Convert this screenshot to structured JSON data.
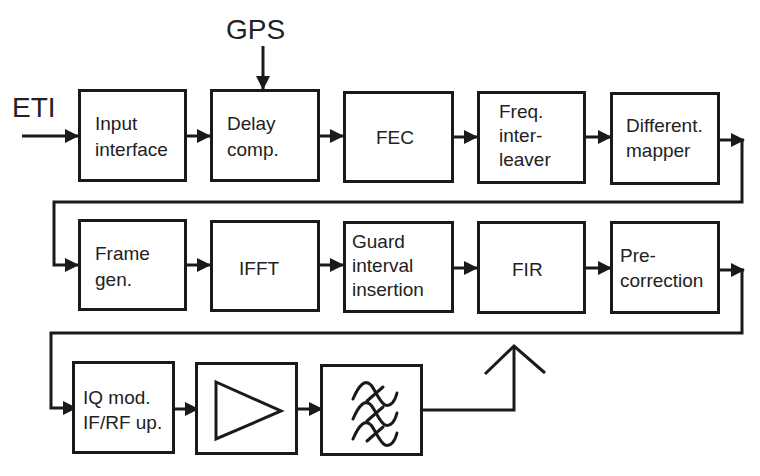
{
  "inputs": {
    "eti": "ETI",
    "gps": "GPS"
  },
  "row1": [
    {
      "id": "input-interface",
      "line1": "Input",
      "line2": "interface",
      "line3": ""
    },
    {
      "id": "delay-comp",
      "line1": "Delay",
      "line2": "comp.",
      "line3": ""
    },
    {
      "id": "fec",
      "line1": "FEC",
      "line2": "",
      "line3": ""
    },
    {
      "id": "freq-interleaver",
      "line1": "Freq.",
      "line2": "inter-",
      "line3": "leaver"
    },
    {
      "id": "differential-mapper",
      "line1": "Different.",
      "line2": "mapper",
      "line3": ""
    }
  ],
  "row2": [
    {
      "id": "frame-gen",
      "line1": "Frame",
      "line2": "gen.",
      "line3": ""
    },
    {
      "id": "ifft",
      "line1": "IFFT",
      "line2": "",
      "line3": ""
    },
    {
      "id": "guard-interval-insertion",
      "line1": "Guard",
      "line2": "interval",
      "line3": "insertion"
    },
    {
      "id": "fir",
      "line1": "FIR",
      "line2": "",
      "line3": ""
    },
    {
      "id": "pre-correction",
      "line1": "Pre-",
      "line2": "correction",
      "line3": ""
    }
  ],
  "row3": [
    {
      "id": "iq-mod",
      "line1": "IQ mod.",
      "line2": "IF/RF up.",
      "line3": ""
    },
    {
      "id": "amplifier",
      "symbol": "amplifier-triangle"
    },
    {
      "id": "bandpass-filter",
      "symbol": "bandpass-filter-waves"
    }
  ],
  "output": {
    "symbol": "antenna"
  }
}
